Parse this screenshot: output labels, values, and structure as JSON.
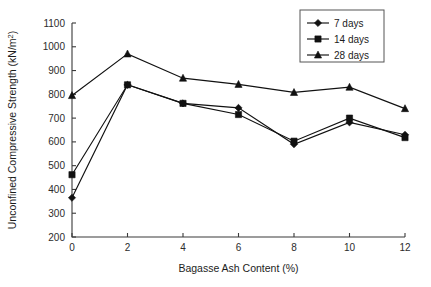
{
  "chart_data": {
    "type": "line",
    "title": "",
    "xlabel": "Bagasse Ash Content (%)",
    "ylabel": "Unconfined Compressive Strength (kN/m²)",
    "ylabel_base": "Unconfined Compressive Strength (kN/m",
    "ylabel_sup": "2",
    "ylabel_tail": ")",
    "x": [
      0,
      2,
      4,
      6,
      8,
      10,
      12
    ],
    "xticklabels": [
      "0",
      "2",
      "4",
      "6",
      "8",
      "10",
      "12"
    ],
    "yticks": [
      200,
      300,
      400,
      500,
      600,
      700,
      800,
      900,
      1000,
      1100
    ],
    "yticklabels": [
      "200",
      "300",
      "400",
      "500",
      "600",
      "700",
      "800",
      "900",
      "1000",
      "1100"
    ],
    "xlim": [
      0,
      12
    ],
    "ylim": [
      200,
      1100
    ],
    "grid": false,
    "legend_position": "top-right",
    "series": [
      {
        "name": "7 days",
        "marker": "diamond",
        "color": "#111111",
        "values": [
          365,
          840,
          762,
          743,
          590,
          682,
          630
        ]
      },
      {
        "name": "14 days",
        "marker": "square",
        "color": "#111111",
        "values": [
          462,
          840,
          762,
          715,
          603,
          700,
          618
        ]
      },
      {
        "name": "28 days",
        "marker": "triangle",
        "color": "#111111",
        "values": [
          795,
          970,
          868,
          842,
          808,
          830,
          740
        ]
      }
    ]
  },
  "legend": {
    "items": [
      {
        "label": "7 days",
        "marker": "diamond"
      },
      {
        "label": "14 days",
        "marker": "square"
      },
      {
        "label": "28 days",
        "marker": "triangle"
      }
    ]
  }
}
